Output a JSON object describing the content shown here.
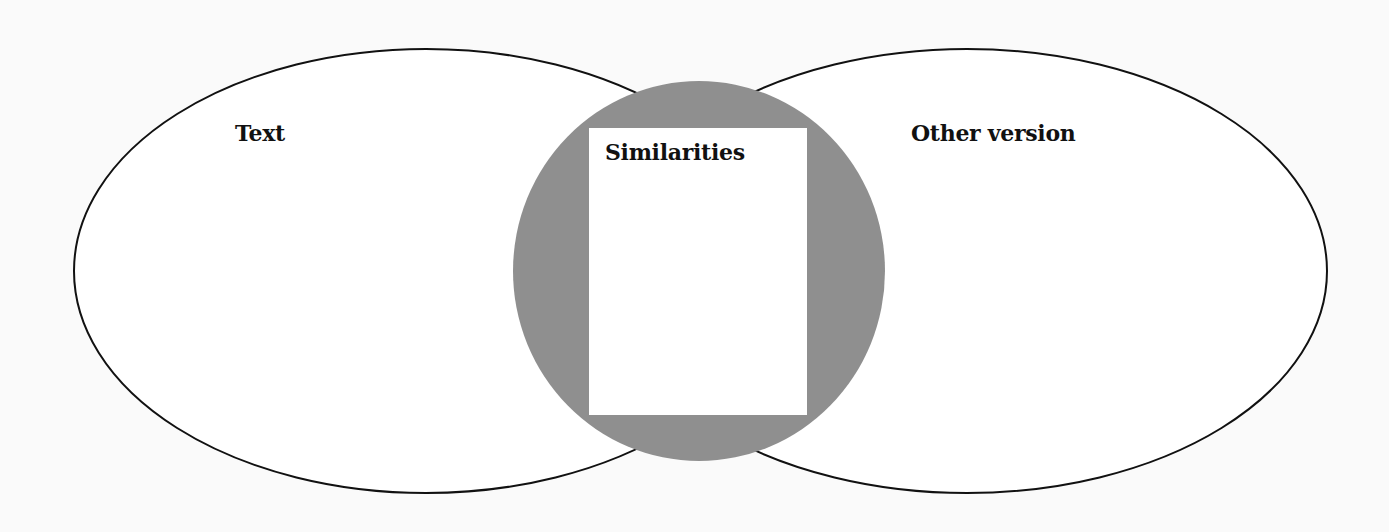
{
  "diagram": {
    "type": "venn",
    "colors": {
      "background": "#fafafa",
      "outline": "#111111",
      "overlap_fill": "#8f8f8f",
      "box_fill": "#ffffff"
    },
    "left_set": {
      "label": "Text"
    },
    "center": {
      "label": "Similarities"
    },
    "right_set": {
      "label": "Other version"
    }
  }
}
